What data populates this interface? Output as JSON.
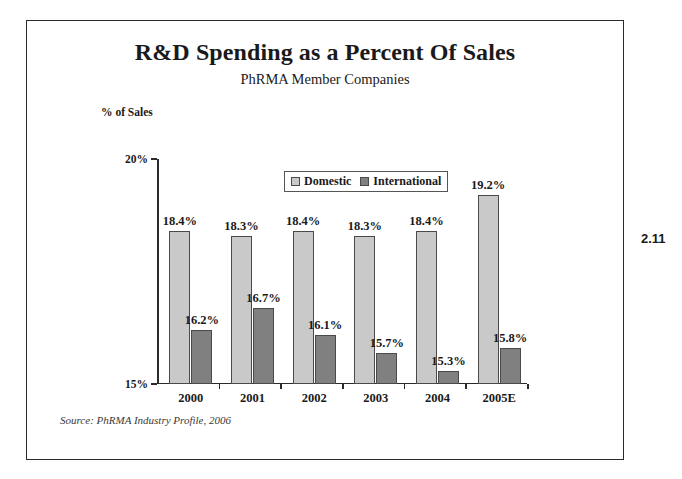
{
  "figure": {
    "number": "2.11"
  },
  "chart_data": {
    "type": "bar",
    "title": "R&D Spending as a Percent Of Sales",
    "subtitle": "PhRMA Member Companies",
    "ylabel": "% of Sales",
    "xlabel": "",
    "ylim": [
      15,
      20
    ],
    "yticks": [
      "15%",
      "20%"
    ],
    "grid": false,
    "legend_position": "top-center",
    "categories": [
      "2000",
      "2001",
      "2002",
      "2003",
      "2004",
      "2005E"
    ],
    "series": [
      {
        "name": "Domestic",
        "color": "#c9c9c9",
        "values": [
          18.4,
          18.3,
          18.4,
          18.3,
          18.4,
          19.2
        ],
        "labels": [
          "18.4%",
          "18.3%",
          "18.4%",
          "18.3%",
          "18.4%",
          "19.2%"
        ]
      },
      {
        "name": "International",
        "color": "#808080",
        "values": [
          16.2,
          16.7,
          16.1,
          15.7,
          15.3,
          15.8
        ],
        "labels": [
          "16.2%",
          "16.7%",
          "16.1%",
          "15.7%",
          "15.3%",
          "15.8%"
        ]
      }
    ],
    "source": "Source: PhRMA Industry Profile, 2006"
  }
}
